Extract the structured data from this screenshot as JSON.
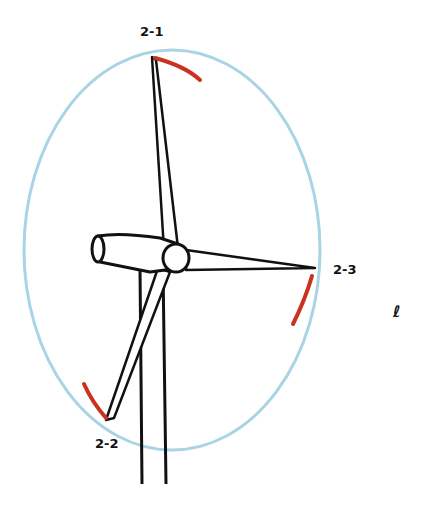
{
  "labels": {
    "tip1": "2-1",
    "tip2": "2-2",
    "tip3": "2-3"
  },
  "mark": "ℓ",
  "colors": {
    "rotor_circle": "#a8d4e6",
    "tip_arc": "#c8321e",
    "outline": "#111111"
  }
}
